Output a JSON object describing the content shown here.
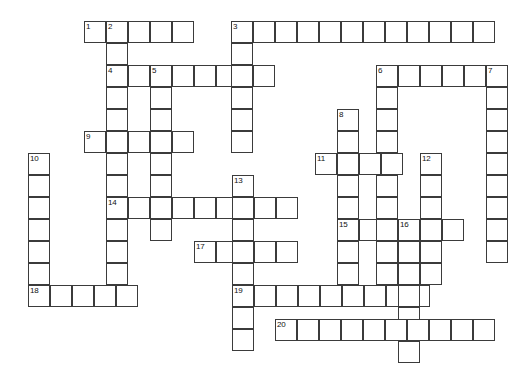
{
  "puzzle": {
    "type": "crossword-grid",
    "title": "",
    "cell_size": 22,
    "grid_origin": {
      "x": 28,
      "y": 21
    },
    "colors": {
      "cell_border": "#3b3b3b",
      "cell_fill": "#ffffff",
      "background": "#ffffff",
      "number_text": "#111111"
    },
    "entries": [
      {
        "number": "1",
        "direction": "across",
        "x": 84,
        "y": 21,
        "length": 5
      },
      {
        "number": "2",
        "direction": "down",
        "x": 106,
        "y": 21,
        "length": 11
      },
      {
        "number": "3",
        "direction": "across",
        "x": 231,
        "y": 21,
        "length": 12
      },
      {
        "number": "3",
        "direction": "down",
        "x": 231,
        "y": 21,
        "length": 6
      },
      {
        "number": "4",
        "direction": "across",
        "x": 106,
        "y": 65,
        "length": 8
      },
      {
        "number": "4",
        "direction": "down",
        "x": 106,
        "y": 65,
        "length": 2
      },
      {
        "number": "5",
        "direction": "down",
        "x": 150,
        "y": 65,
        "length": 11
      },
      {
        "number": "6",
        "direction": "across",
        "x": 376,
        "y": 65,
        "length": 6
      },
      {
        "number": "6",
        "direction": "down",
        "x": 376,
        "y": 65,
        "length": 9
      },
      {
        "number": "7",
        "direction": "down",
        "x": 486,
        "y": 65,
        "length": 8
      },
      {
        "number": "8",
        "direction": "down",
        "x": 337,
        "y": 109,
        "length": 5
      },
      {
        "number": "9",
        "direction": "across",
        "x": 84,
        "y": 131,
        "length": 5
      },
      {
        "number": "10",
        "direction": "down",
        "x": 28,
        "y": 153,
        "length": 6
      },
      {
        "number": "11",
        "direction": "across",
        "x": 315,
        "y": 153,
        "length": 4
      },
      {
        "number": "12",
        "direction": "down",
        "x": 420,
        "y": 153,
        "length": 8
      },
      {
        "number": "13",
        "direction": "down",
        "x": 232,
        "y": 175,
        "length": 8
      },
      {
        "number": "14",
        "direction": "across",
        "x": 106,
        "y": 197,
        "length": 8
      },
      {
        "number": "15",
        "direction": "across",
        "x": 337,
        "y": 219,
        "length": 6
      },
      {
        "number": "16",
        "direction": "down",
        "x": 398,
        "y": 219,
        "length": 5
      },
      {
        "number": "17",
        "direction": "across",
        "x": 194,
        "y": 241,
        "length": 5
      },
      {
        "number": "18",
        "direction": "across",
        "x": 28,
        "y": 285,
        "length": 5
      },
      {
        "number": "19",
        "direction": "across",
        "x": 232,
        "y": 285,
        "length": 9
      },
      {
        "number": "19",
        "direction": "down",
        "x": 232,
        "y": 285,
        "length": 3
      },
      {
        "number": "20",
        "direction": "across",
        "x": 275,
        "y": 319,
        "length": 10
      }
    ],
    "cells": [
      {
        "x": 84,
        "y": 21,
        "num": "1"
      },
      {
        "x": 106,
        "y": 21,
        "num": "2"
      },
      {
        "x": 128,
        "y": 21,
        "num": ""
      },
      {
        "x": 150,
        "y": 21,
        "num": ""
      },
      {
        "x": 172,
        "y": 21,
        "num": ""
      },
      {
        "x": 231,
        "y": 21,
        "num": "3"
      },
      {
        "x": 253,
        "y": 21,
        "num": ""
      },
      {
        "x": 275,
        "y": 21,
        "num": ""
      },
      {
        "x": 297,
        "y": 21,
        "num": ""
      },
      {
        "x": 319,
        "y": 21,
        "num": ""
      },
      {
        "x": 341,
        "y": 21,
        "num": ""
      },
      {
        "x": 363,
        "y": 21,
        "num": ""
      },
      {
        "x": 385,
        "y": 21,
        "num": ""
      },
      {
        "x": 407,
        "y": 21,
        "num": ""
      },
      {
        "x": 429,
        "y": 21,
        "num": ""
      },
      {
        "x": 451,
        "y": 21,
        "num": ""
      },
      {
        "x": 473,
        "y": 21,
        "num": ""
      },
      {
        "x": 106,
        "y": 43,
        "num": ""
      },
      {
        "x": 231,
        "y": 43,
        "num": ""
      },
      {
        "x": 106,
        "y": 65,
        "num": "4"
      },
      {
        "x": 128,
        "y": 65,
        "num": ""
      },
      {
        "x": 150,
        "y": 65,
        "num": "5"
      },
      {
        "x": 172,
        "y": 65,
        "num": ""
      },
      {
        "x": 194,
        "y": 65,
        "num": ""
      },
      {
        "x": 216,
        "y": 65,
        "num": ""
      },
      {
        "x": 231,
        "y": 65,
        "num": ""
      },
      {
        "x": 253,
        "y": 65,
        "num": ""
      },
      {
        "x": 376,
        "y": 65,
        "num": "6"
      },
      {
        "x": 398,
        "y": 65,
        "num": ""
      },
      {
        "x": 420,
        "y": 65,
        "num": ""
      },
      {
        "x": 442,
        "y": 65,
        "num": ""
      },
      {
        "x": 464,
        "y": 65,
        "num": ""
      },
      {
        "x": 486,
        "y": 65,
        "num": "7"
      },
      {
        "x": 106,
        "y": 87,
        "num": ""
      },
      {
        "x": 150,
        "y": 87,
        "num": ""
      },
      {
        "x": 231,
        "y": 87,
        "num": ""
      },
      {
        "x": 376,
        "y": 87,
        "num": ""
      },
      {
        "x": 486,
        "y": 87,
        "num": ""
      },
      {
        "x": 106,
        "y": 109,
        "num": ""
      },
      {
        "x": 150,
        "y": 109,
        "num": ""
      },
      {
        "x": 231,
        "y": 109,
        "num": ""
      },
      {
        "x": 337,
        "y": 109,
        "num": "8"
      },
      {
        "x": 376,
        "y": 109,
        "num": ""
      },
      {
        "x": 486,
        "y": 109,
        "num": ""
      },
      {
        "x": 84,
        "y": 131,
        "num": "9"
      },
      {
        "x": 106,
        "y": 131,
        "num": ""
      },
      {
        "x": 128,
        "y": 131,
        "num": ""
      },
      {
        "x": 150,
        "y": 131,
        "num": ""
      },
      {
        "x": 172,
        "y": 131,
        "num": ""
      },
      {
        "x": 231,
        "y": 131,
        "num": ""
      },
      {
        "x": 337,
        "y": 131,
        "num": ""
      },
      {
        "x": 376,
        "y": 131,
        "num": ""
      },
      {
        "x": 486,
        "y": 131,
        "num": ""
      },
      {
        "x": 28,
        "y": 153,
        "num": "10"
      },
      {
        "x": 106,
        "y": 153,
        "num": ""
      },
      {
        "x": 150,
        "y": 153,
        "num": ""
      },
      {
        "x": 315,
        "y": 153,
        "num": "11"
      },
      {
        "x": 337,
        "y": 153,
        "num": ""
      },
      {
        "x": 359,
        "y": 153,
        "num": ""
      },
      {
        "x": 381,
        "y": 153,
        "num": ""
      },
      {
        "x": 420,
        "y": 153,
        "num": "12"
      },
      {
        "x": 486,
        "y": 153,
        "num": ""
      },
      {
        "x": 28,
        "y": 175,
        "num": ""
      },
      {
        "x": 106,
        "y": 175,
        "num": ""
      },
      {
        "x": 150,
        "y": 175,
        "num": ""
      },
      {
        "x": 232,
        "y": 175,
        "num": "13"
      },
      {
        "x": 337,
        "y": 175,
        "num": ""
      },
      {
        "x": 376,
        "y": 175,
        "num": ""
      },
      {
        "x": 420,
        "y": 175,
        "num": ""
      },
      {
        "x": 486,
        "y": 175,
        "num": ""
      },
      {
        "x": 28,
        "y": 197,
        "num": ""
      },
      {
        "x": 106,
        "y": 197,
        "num": "14"
      },
      {
        "x": 128,
        "y": 197,
        "num": ""
      },
      {
        "x": 150,
        "y": 197,
        "num": ""
      },
      {
        "x": 172,
        "y": 197,
        "num": ""
      },
      {
        "x": 194,
        "y": 197,
        "num": ""
      },
      {
        "x": 216,
        "y": 197,
        "num": ""
      },
      {
        "x": 232,
        "y": 197,
        "num": ""
      },
      {
        "x": 254,
        "y": 197,
        "num": ""
      },
      {
        "x": 276,
        "y": 197,
        "num": ""
      },
      {
        "x": 337,
        "y": 197,
        "num": ""
      },
      {
        "x": 376,
        "y": 197,
        "num": ""
      },
      {
        "x": 420,
        "y": 197,
        "num": ""
      },
      {
        "x": 486,
        "y": 197,
        "num": ""
      },
      {
        "x": 28,
        "y": 219,
        "num": ""
      },
      {
        "x": 106,
        "y": 219,
        "num": ""
      },
      {
        "x": 150,
        "y": 219,
        "num": ""
      },
      {
        "x": 232,
        "y": 219,
        "num": ""
      },
      {
        "x": 337,
        "y": 219,
        "num": "15"
      },
      {
        "x": 359,
        "y": 219,
        "num": ""
      },
      {
        "x": 376,
        "y": 219,
        "num": ""
      },
      {
        "x": 398,
        "y": 219,
        "num": "16"
      },
      {
        "x": 420,
        "y": 219,
        "num": ""
      },
      {
        "x": 442,
        "y": 219,
        "num": ""
      },
      {
        "x": 486,
        "y": 219,
        "num": ""
      },
      {
        "x": 28,
        "y": 241,
        "num": ""
      },
      {
        "x": 106,
        "y": 241,
        "num": ""
      },
      {
        "x": 194,
        "y": 241,
        "num": "17"
      },
      {
        "x": 216,
        "y": 241,
        "num": ""
      },
      {
        "x": 232,
        "y": 241,
        "num": ""
      },
      {
        "x": 254,
        "y": 241,
        "num": ""
      },
      {
        "x": 276,
        "y": 241,
        "num": ""
      },
      {
        "x": 337,
        "y": 241,
        "num": ""
      },
      {
        "x": 376,
        "y": 241,
        "num": ""
      },
      {
        "x": 398,
        "y": 241,
        "num": ""
      },
      {
        "x": 420,
        "y": 241,
        "num": ""
      },
      {
        "x": 486,
        "y": 241,
        "num": ""
      },
      {
        "x": 28,
        "y": 263,
        "num": ""
      },
      {
        "x": 106,
        "y": 263,
        "num": ""
      },
      {
        "x": 232,
        "y": 263,
        "num": ""
      },
      {
        "x": 337,
        "y": 263,
        "num": ""
      },
      {
        "x": 376,
        "y": 263,
        "num": ""
      },
      {
        "x": 398,
        "y": 263,
        "num": ""
      },
      {
        "x": 420,
        "y": 263,
        "num": ""
      },
      {
        "x": 28,
        "y": 285,
        "num": "18"
      },
      {
        "x": 50,
        "y": 285,
        "num": ""
      },
      {
        "x": 72,
        "y": 285,
        "num": ""
      },
      {
        "x": 94,
        "y": 285,
        "num": ""
      },
      {
        "x": 116,
        "y": 285,
        "num": ""
      },
      {
        "x": 232,
        "y": 285,
        "num": "19"
      },
      {
        "x": 254,
        "y": 285,
        "num": ""
      },
      {
        "x": 276,
        "y": 285,
        "num": ""
      },
      {
        "x": 298,
        "y": 285,
        "num": ""
      },
      {
        "x": 320,
        "y": 285,
        "num": ""
      },
      {
        "x": 342,
        "y": 285,
        "num": ""
      },
      {
        "x": 364,
        "y": 285,
        "num": ""
      },
      {
        "x": 386,
        "y": 285,
        "num": ""
      },
      {
        "x": 408,
        "y": 285,
        "num": ""
      },
      {
        "x": 398,
        "y": 285,
        "num": ""
      },
      {
        "x": 232,
        "y": 307,
        "num": ""
      },
      {
        "x": 398,
        "y": 307,
        "num": ""
      },
      {
        "x": 232,
        "y": 329,
        "num": ""
      },
      {
        "x": 275,
        "y": 319,
        "num": "20"
      },
      {
        "x": 297,
        "y": 319,
        "num": ""
      },
      {
        "x": 319,
        "y": 319,
        "num": ""
      },
      {
        "x": 341,
        "y": 319,
        "num": ""
      },
      {
        "x": 363,
        "y": 319,
        "num": ""
      },
      {
        "x": 385,
        "y": 319,
        "num": ""
      },
      {
        "x": 407,
        "y": 319,
        "num": ""
      },
      {
        "x": 429,
        "y": 319,
        "num": ""
      },
      {
        "x": 451,
        "y": 319,
        "num": ""
      },
      {
        "x": 473,
        "y": 319,
        "num": ""
      },
      {
        "x": 398,
        "y": 341,
        "num": ""
      }
    ]
  }
}
